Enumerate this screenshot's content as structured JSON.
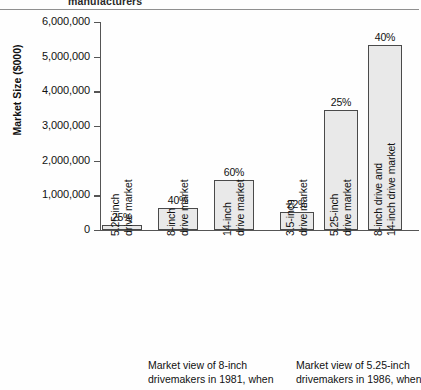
{
  "header": {
    "cut_off_word": "manufacturers"
  },
  "chart_data": {
    "type": "bar",
    "title": "",
    "xlabel": "",
    "ylabel": "Market Size ($000)",
    "ylim": [
      0,
      6000000
    ],
    "ytick_labels": [
      "6,000,000",
      "5,000,000",
      "4,000,000",
      "3,000,000",
      "2,000,000",
      "1,000,000",
      "0"
    ],
    "ytick_values": [
      6000000,
      5000000,
      4000000,
      3000000,
      2000000,
      1000000,
      0
    ],
    "grid": false,
    "legend": "none",
    "categories": [
      "5.25-inch drive market",
      "8-inch drive market",
      "14-inch drive market",
      "3.5-inch drive market",
      "5.25-inch drive market",
      "8-inch drive and 14-inch drive market"
    ],
    "values": [
      150000,
      630000,
      1440000,
      520000,
      3450000,
      5350000
    ],
    "data_labels": [
      "25%",
      "40%",
      "60%",
      "22%",
      "25%",
      "40%"
    ],
    "bar_color": "#e9e9e9",
    "bar_edge_color": "#4a4a4a",
    "groups": [
      {
        "caption_line1": "Market view of 8-inch",
        "caption_line2": "drivemakers in 1981, when",
        "category_indices": [
          0,
          1,
          2
        ]
      },
      {
        "caption_line1": "Market view of 5.25-inch",
        "caption_line2": "drivemakers in 1986, when",
        "category_indices": [
          3,
          4,
          5
        ]
      }
    ]
  },
  "categories": [
    {
      "line1": "5.25-inch",
      "line2": "drive market"
    },
    {
      "line1": "8-inch",
      "line2": "drive market"
    },
    {
      "line1": "14-inch",
      "line2": "drive market"
    },
    {
      "line1": "3.5-inch",
      "line2": "drive market"
    },
    {
      "line1": "5.25-inch",
      "line2": "drive market"
    },
    {
      "line1": "8-inch drive and",
      "line2": "14-inch drive market"
    }
  ],
  "captions": [
    {
      "line1": "Market view of 8-inch",
      "line2": "drivemakers in 1981, when"
    },
    {
      "line1": "Market view of 5.25-inch",
      "line2": "drivemakers in 1986, when"
    }
  ]
}
